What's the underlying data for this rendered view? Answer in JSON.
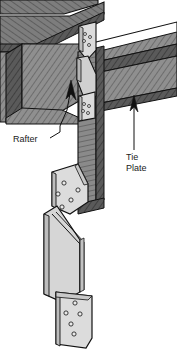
{
  "figure": {
    "background_color": "#ffffff",
    "line_color": "#111111",
    "wood_fill": "#8c8c8c",
    "wood_dark_fill": "#4a4a4a",
    "wood_mid_fill": "#6e6e6e",
    "metal_fill": "#d8d8d8",
    "metal_shade_fill": "#bdbdbd",
    "hole_fill": "#e8e8e8"
  },
  "labels": [
    {
      "id": "rafter",
      "text": "Rafter",
      "x": 13,
      "y": 142,
      "anchor": "start"
    },
    {
      "id": "tie-plate-line1",
      "text": "Tie",
      "x": 126,
      "y": 160,
      "anchor": "start"
    },
    {
      "id": "tie-plate-line2",
      "text": "Plate",
      "x": 126,
      "y": 171,
      "anchor": "start"
    }
  ],
  "leaders": [
    {
      "id": "rafter-leader",
      "description": "leader from Rafter label up to arrowhead on rafter beam",
      "path": "M 50 138 L 60 132 L 60 126 L 67 110 L 71 88"
    },
    {
      "id": "tie-plate-leader",
      "description": "vertical leader from Tie Plate label up to tie plate beam",
      "path": "M 134 150 L 134 104"
    }
  ],
  "arrowheads": [
    {
      "id": "rafter-arrowhead",
      "points": "71,80 66,98 71,94 76,99"
    },
    {
      "id": "tie-plate-arrowhead",
      "points": "134,96 130,110 134,106 138,111"
    }
  ],
  "parts": {
    "rafter_beam": {
      "name": "Rafter",
      "fill": "#8c8c8c",
      "hatched": true
    },
    "tie_plate_beam": {
      "name": "Tie Plate",
      "fill": "#8c8c8c",
      "hatched": true
    },
    "post": {
      "name": "Vertical Post",
      "fill": "#8c8c8c",
      "hatched": true
    },
    "upper_connector": {
      "name": "Upper Metal Tie Plate",
      "fill": "#d8d8d8",
      "hole_count": 4
    },
    "middle_connector": {
      "name": "Middle Metal Tie Plate",
      "fill": "#d8d8d8",
      "hole_count": 4
    },
    "detail_connector_top": {
      "name": "Detached Tie Plate Detail (upper)",
      "fill": "#d8d8d8",
      "hole_count": 5
    },
    "detail_connector_bottom": {
      "name": "Detached Tie Plate Detail (lower)",
      "fill": "#d8d8d8",
      "hole_count": 5
    }
  },
  "holes": {
    "upper_connector": [
      {
        "cx": 85,
        "cy": 34,
        "r": 1.5
      },
      {
        "cx": 90,
        "cy": 37,
        "r": 1.5
      },
      {
        "cx": 84,
        "cy": 41,
        "r": 1.5
      },
      {
        "cx": 89,
        "cy": 45,
        "r": 1.5
      }
    ],
    "middle_connector": [
      {
        "cx": 84,
        "cy": 104,
        "r": 1.5
      },
      {
        "cx": 89,
        "cy": 106,
        "r": 1.5
      },
      {
        "cx": 83,
        "cy": 111,
        "r": 1.5
      },
      {
        "cx": 88,
        "cy": 113,
        "r": 1.5
      }
    ],
    "detail_connector_top": [
      {
        "cx": 64,
        "cy": 183,
        "r": 2.1
      },
      {
        "cx": 78,
        "cy": 190,
        "r": 2.1
      },
      {
        "cx": 58,
        "cy": 194,
        "r": 2.1
      },
      {
        "cx": 71,
        "cy": 200,
        "r": 2.1
      },
      {
        "cx": 62,
        "cy": 207,
        "r": 2.1
      }
    ],
    "detail_connector_bottom": [
      {
        "cx": 75,
        "cy": 303,
        "r": 2.1
      },
      {
        "cx": 66,
        "cy": 313,
        "r": 2.1
      },
      {
        "cx": 80,
        "cy": 314,
        "r": 2.1
      },
      {
        "cx": 71,
        "cy": 324,
        "r": 2.1
      },
      {
        "cx": 74,
        "cy": 334,
        "r": 2.1
      }
    ]
  }
}
